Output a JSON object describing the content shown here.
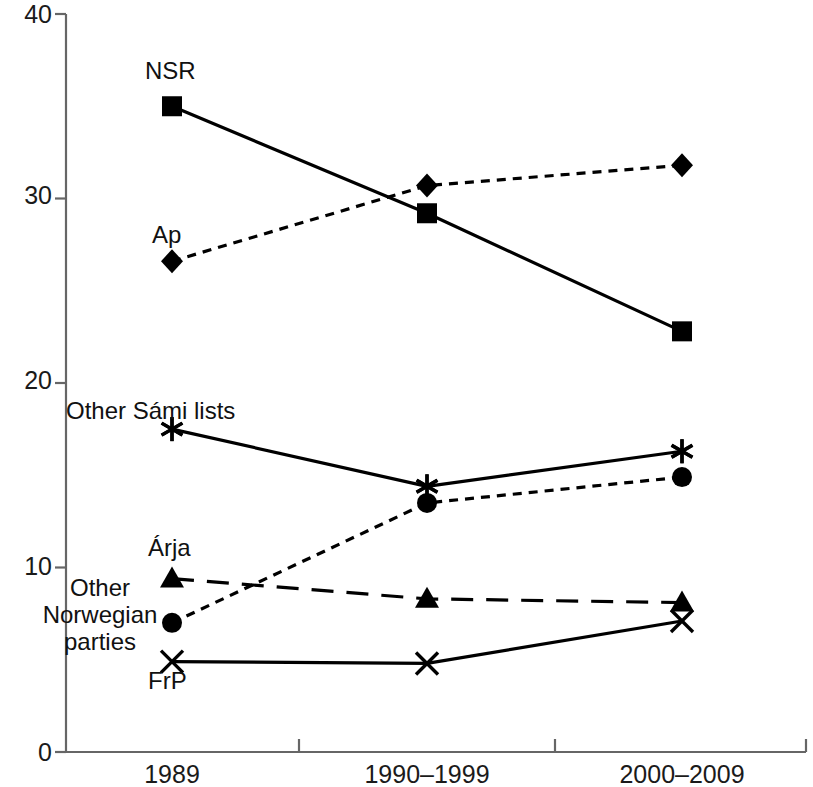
{
  "chart_data": {
    "type": "line",
    "title": "",
    "subtitle": "",
    "xlabel": "",
    "ylabel": "",
    "categories": [
      "1989",
      "1990–1999",
      "2000–2009"
    ],
    "ylim": [
      0,
      40
    ],
    "yticks": [
      0,
      10,
      20,
      30,
      40
    ],
    "ytick_labels": [
      "0",
      "10",
      "20",
      "30",
      "40"
    ],
    "grid": false,
    "legend": "inline-labels-left",
    "series": [
      {
        "name": "NSR",
        "marker": "square",
        "linestyle": "solid",
        "color": "#000000",
        "values": [
          35.0,
          29.2,
          22.8
        ]
      },
      {
        "name": "Ap",
        "marker": "diamond",
        "linestyle": "dotted",
        "color": "#000000",
        "values": [
          26.6,
          30.7,
          31.8
        ]
      },
      {
        "name": "Other Sámi lists",
        "marker": "asterisk",
        "linestyle": "solid",
        "color": "#000000",
        "values": [
          17.5,
          14.4,
          16.3
        ]
      },
      {
        "name": "Other\nNorwegian\nparties",
        "marker": "circle",
        "linestyle": "dotted",
        "color": "#000000",
        "values": [
          7.0,
          13.5,
          14.9
        ]
      },
      {
        "name": "Árja",
        "marker": "triangle",
        "linestyle": "dashed",
        "color": "#000000",
        "values": [
          9.4,
          8.3,
          8.1
        ]
      },
      {
        "name": "FrP",
        "marker": "cross",
        "linestyle": "solid",
        "color": "#000000",
        "values": [
          4.9,
          4.8,
          7.1
        ]
      }
    ]
  },
  "axis": {
    "tick_labels_y": [
      "40",
      "30",
      "20",
      "10",
      "0"
    ],
    "tick_labels_x": [
      "1989",
      "1990–1999",
      "2000–2009"
    ],
    "axis_color": "#555555"
  },
  "labels": {
    "nsr": "NSR",
    "ap": "Ap",
    "other_sami": "Other Sámi lists",
    "arja": "Árja",
    "other_norwegian": "Other\nNorwegian\nparties",
    "frp": "FrP"
  }
}
